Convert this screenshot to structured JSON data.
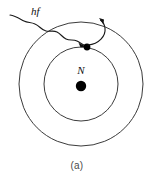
{
  "figure": {
    "caption": "(a)",
    "background_color": "#ffffff",
    "line_color": "#3b3b3b",
    "ink_color": "#111111",
    "width": 154,
    "height": 182
  },
  "labels": {
    "photon": "hf",
    "nucleus": "N"
  },
  "diagram_data": {
    "type": "bohr-atom-photon-absorption",
    "center": {
      "x": 81,
      "y": 84
    },
    "orbits": [
      {
        "name": "inner-orbit",
        "radius": 37
      },
      {
        "name": "outer-orbit",
        "radius": 62
      }
    ],
    "nucleus": {
      "x": 81,
      "y": 86,
      "radius": 5,
      "label": "N"
    },
    "electron": {
      "x": 87,
      "y": 47,
      "radius": 3.4,
      "on_orbit": "inner-orbit"
    },
    "incoming_photon": {
      "label": "hf",
      "style": "wavy-arrow",
      "start": {
        "x": 10,
        "y": 15
      },
      "end": {
        "x": 84,
        "y": 45
      }
    },
    "ejection_arrow": {
      "style": "curved-arrow",
      "start": {
        "x": 88,
        "y": 46
      },
      "end": {
        "x": 100,
        "y": 19
      },
      "direction": "outward-up"
    }
  }
}
